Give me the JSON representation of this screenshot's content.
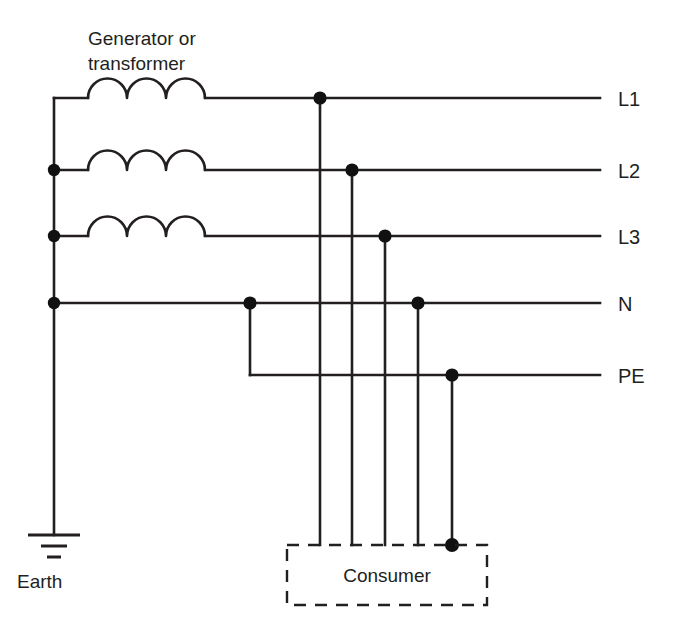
{
  "diagram": {
    "type": "electrical-distribution-schematic",
    "system": "three-phase supply with neutral and protective earth",
    "background_color": "#ffffff",
    "line_color": "#231f20",
    "node_color": "#111111",
    "source": {
      "label_line1": "Generator or",
      "label_line2": "transformer",
      "winding_count": 3,
      "winding_symbol": "coil-three-humps"
    },
    "earth": {
      "label": "Earth",
      "symbol": "earth-ground-three-bars",
      "bar_widths": [
        52,
        27,
        14
      ]
    },
    "consumer": {
      "label": "Consumer",
      "box_style": "dashed",
      "incoming_drops": 5
    },
    "rails": [
      {
        "id": "L1",
        "label": "L1",
        "y": 98,
        "tap_x": 320,
        "left_x": 54,
        "has_coil": true,
        "left_junction_dot": false,
        "tap_dot": true
      },
      {
        "id": "L2",
        "label": "L2",
        "y": 170,
        "tap_x": 352,
        "left_x": 54,
        "has_coil": true,
        "left_junction_dot": true,
        "tap_dot": true
      },
      {
        "id": "L3",
        "label": "L3",
        "y": 236,
        "tap_x": 385,
        "left_x": 54,
        "has_coil": true,
        "left_junction_dot": true,
        "tap_dot": true
      },
      {
        "id": "N",
        "label": "N",
        "y": 303,
        "tap_x": 418,
        "left_x": 54,
        "has_coil": false,
        "left_junction_dot": true,
        "tap_dot": true
      },
      {
        "id": "PE",
        "label": "PE",
        "y": 375,
        "tap_x": 452,
        "left_x": 250,
        "has_coil": false,
        "left_junction_dot": false,
        "tap_dot": true
      }
    ],
    "pen_link": {
      "description": "neutral to protective-earth bond",
      "from_rail": "N",
      "to_rail": "PE",
      "x": 250,
      "dot": true
    },
    "labels": {
      "rail_label_x": 618,
      "rail_end_x": 600
    }
  }
}
